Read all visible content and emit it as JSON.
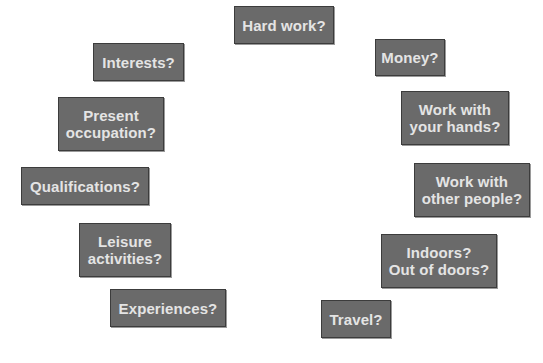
{
  "diagram": {
    "type": "radial-question-cloud",
    "colors": {
      "background": "#ffffff",
      "box_fill": "#6a6a6a",
      "box_border": "#3c3c3c",
      "box_text": "#e4e4e4"
    },
    "boxes": [
      {
        "id": "hard-work",
        "lines": [
          "Hard work?"
        ]
      },
      {
        "id": "money",
        "lines": [
          "Money?"
        ]
      },
      {
        "id": "work-with-hands",
        "lines": [
          "Work with",
          "your hands?"
        ]
      },
      {
        "id": "work-with-people",
        "lines": [
          "Work with",
          "other people?"
        ]
      },
      {
        "id": "indoors-outdoors",
        "lines": [
          "Indoors?",
          "Out of doors?"
        ]
      },
      {
        "id": "travel",
        "lines": [
          "Travel?"
        ]
      },
      {
        "id": "experiences",
        "lines": [
          "Experiences?"
        ]
      },
      {
        "id": "leisure-activities",
        "lines": [
          "Leisure",
          "activities?"
        ]
      },
      {
        "id": "qualifications",
        "lines": [
          "Qualifications?"
        ]
      },
      {
        "id": "present-occupation",
        "lines": [
          "Present",
          "occupation?"
        ]
      },
      {
        "id": "interests",
        "lines": [
          "Interests?"
        ]
      }
    ]
  }
}
